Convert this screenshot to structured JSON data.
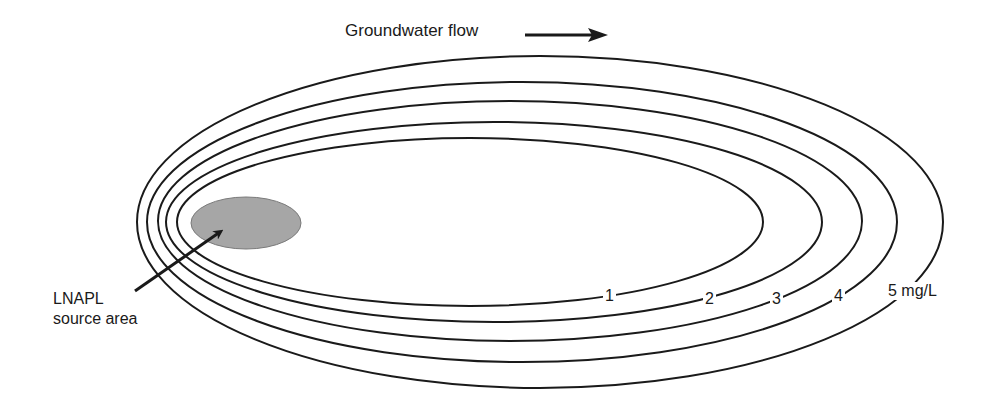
{
  "title": "Groundwater flow",
  "source_label": {
    "line1": "LNAPL",
    "line2": "source area"
  },
  "contours": [
    {
      "value": "1",
      "label": "1"
    },
    {
      "value": "2",
      "label": "2"
    },
    {
      "value": "3",
      "label": "3"
    },
    {
      "value": "4",
      "label": "4"
    },
    {
      "value": "5",
      "label": "5 mg/L"
    }
  ],
  "colors": {
    "line": "#1a1a1a",
    "source_fill": "#a6a6a6",
    "background": "#ffffff"
  }
}
